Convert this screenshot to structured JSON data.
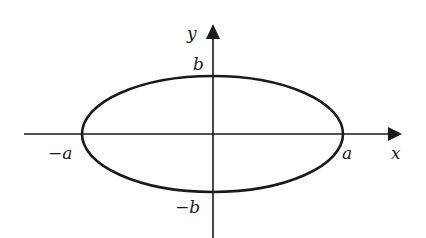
{
  "diagram": {
    "type": "ellipse-on-axes",
    "colors": {
      "stroke": "#1a1a1a",
      "background": "#ffffff"
    },
    "axes": {
      "x_label": "x",
      "y_label": "y"
    },
    "ellipse": {
      "semi_major_label": "a",
      "semi_major_neg_label": "−a",
      "semi_minor_label": "b",
      "semi_minor_neg_label": "−b"
    }
  }
}
